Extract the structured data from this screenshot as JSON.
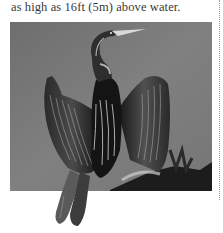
{
  "article": {
    "caption_text": "as high as 16ft (5m) above water."
  },
  "figure": {
    "colors": {
      "background_gray": "#7c7c7c",
      "bird_dark": "#1a1a1a",
      "highlight": "#d8d8d8"
    }
  },
  "layout": {
    "divider_style": "dotted",
    "divider_color": "#9a9a9a"
  }
}
